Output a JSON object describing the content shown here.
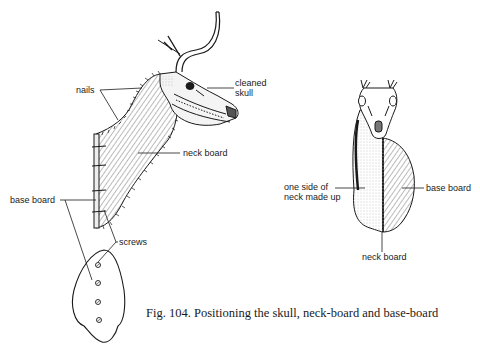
{
  "figure": {
    "caption": "Fig. 104. Positioning the skull, neck-board and base-board",
    "colors": {
      "ink": "#1a1a1a",
      "background": "#ffffff",
      "hatch": "#444444",
      "stipple": "#777777"
    }
  },
  "side_view": {
    "labels": {
      "nails": "nails",
      "cleaned_skull_line1": "cleaned",
      "cleaned_skull_line2": "skull",
      "neck_board": "neck board",
      "base_board": "base board",
      "screws": "screws"
    },
    "screw_count": 4
  },
  "front_view": {
    "labels": {
      "one_side_line1": "one side of",
      "one_side_line2": "neck made up",
      "base_board": "base board",
      "neck_board": "neck board"
    }
  }
}
